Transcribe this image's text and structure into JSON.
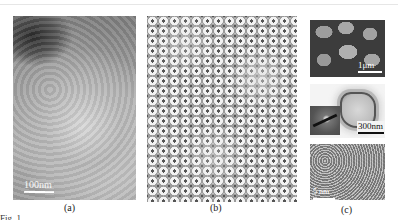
{
  "figure": {
    "panels": [
      {
        "id": "a",
        "label": "(a)",
        "scale_bar": "100nm",
        "kind": "SEM image of aggregated nanoparticles"
      },
      {
        "id": "b",
        "label": "(b)",
        "scale_bar": "",
        "kind": "TEM image of close-packed ring-shaped nanoparticles"
      },
      {
        "id": "c",
        "label": "(c)",
        "subpanels": [
          {
            "position": "top",
            "scale_bar": "1μm",
            "kind": "SEM image of faceted particles"
          },
          {
            "position": "middle",
            "scale_bar": "300nm",
            "kind": "TEM image of single particle with SAED inset"
          },
          {
            "position": "bottom",
            "scale_bar": "5 nm",
            "kind": "HRTEM lattice image"
          }
        ]
      }
    ],
    "caption": "Fig. 1 ..."
  }
}
